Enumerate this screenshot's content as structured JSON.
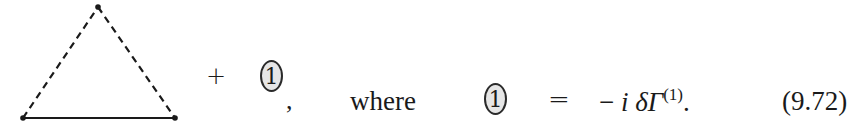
{
  "equation": {
    "diagram": {
      "type": "triangle-vertex-diagram",
      "vertices": {
        "top": [
          98,
          7
        ],
        "bottom_left": [
          23,
          118
        ],
        "bottom_right": [
          175,
          118
        ]
      },
      "edges": [
        {
          "from": "bottom_left",
          "to": "top",
          "style": "dashed"
        },
        {
          "from": "top",
          "to": "bottom_right",
          "style": "dashed"
        },
        {
          "from": "bottom_left",
          "to": "bottom_right",
          "style": "solid"
        }
      ]
    },
    "plus_sign": "+",
    "counterterm_label": "1",
    "comma": ",",
    "where_text": "where",
    "definition_label": "1",
    "equals_sign": "=",
    "rhs": {
      "minus": "−",
      "i": "i",
      "delta_gamma": "δΓ",
      "superscript": "(1)",
      "period": "."
    },
    "equation_number": "(9.72)"
  }
}
